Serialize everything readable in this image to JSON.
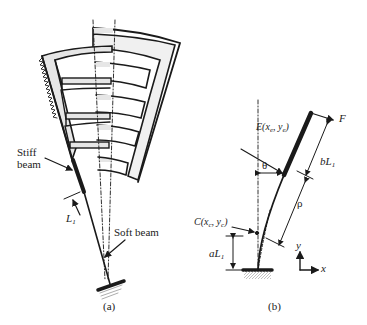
{
  "figure": {
    "panel_a": {
      "caption": "(a)",
      "labels": {
        "stiff_beam_line1": "Stiff",
        "stiff_beam_line2": "beam",
        "L1": "L",
        "L1_sub": "1",
        "soft_beam": "Soft beam"
      }
    },
    "panel_b": {
      "caption": "(b)",
      "labels": {
        "E_point": "E(x",
        "E_sub": "e",
        "E_mid": ", y",
        "E_sub2": "e",
        "E_end": ")",
        "F": "F",
        "theta": "θ",
        "bL1": "bL",
        "bL1_sub": "1",
        "rho": "ρ",
        "C_point": "C(x",
        "C_sub": "c",
        "C_mid": ", y",
        "C_sub2": "c",
        "C_end": ")",
        "aL1": "aL",
        "aL1_sub": "1",
        "y_axis": "y",
        "x_axis": "x"
      }
    },
    "colors": {
      "stroke": "#1a1a1a",
      "fill_gray": "#e6e6e6"
    }
  }
}
